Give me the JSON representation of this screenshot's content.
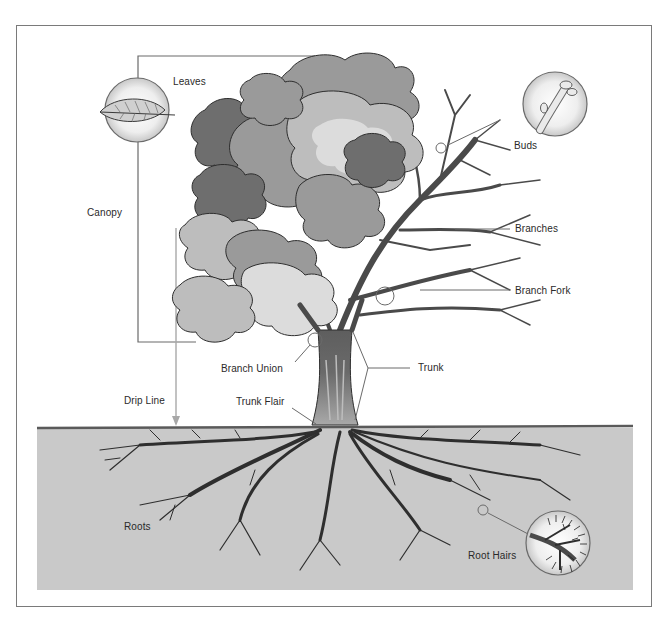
{
  "diagram": {
    "colors": {
      "frame": "#7a7a7a",
      "ground": "#c9c9c9",
      "ground_line": "#5a5a5a",
      "leader": "#6a6a6a",
      "drip_line": "#a8a8a8",
      "canopy_dark": "#6e6e6e",
      "canopy_mid": "#9a9a9a",
      "canopy_light": "#bdbdbd",
      "canopy_pale": "#dcdcdc",
      "trunk_dark": "#5a5a5a",
      "trunk_light": "#a0a0a0",
      "branch": "#4a4a4a",
      "root": "#2e2e2e"
    },
    "labels": {
      "leaves": "Leaves",
      "canopy": "Canopy",
      "buds": "Buds",
      "branches": "Branches",
      "branch_fork": "Branch Fork",
      "branch_union": "Branch Union",
      "trunk": "Trunk",
      "drip_line": "Drip Line",
      "trunk_flair": "Trunk Flair",
      "roots": "Roots",
      "root_hairs": "Root Hairs"
    }
  }
}
